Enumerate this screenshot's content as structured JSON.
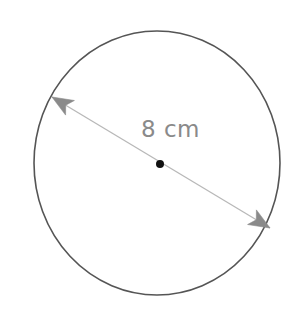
{
  "figure": {
    "name": "circle-with-diameter",
    "type": "geometry-diagram",
    "background_color": "#ffffff",
    "width": 304,
    "height": 311,
    "shape": {
      "name": "circle",
      "center": {
        "x": 157,
        "y": 163
      },
      "radius": 123,
      "stroke_color": "#555555",
      "stroke_width": 1.6,
      "fill": "none"
    },
    "center_point": {
      "name": "center-dot",
      "x": 160,
      "y": 164,
      "radius": 4,
      "color": "#111111"
    },
    "diameter": {
      "name": "diameter-arrow",
      "measure_value": "8 cm",
      "number": "8",
      "unit": "cm",
      "line_color": "#b8b8b8",
      "arrow_color": "#8a8a8a",
      "line_width": 1.3,
      "start": {
        "x": 52,
        "y": 97
      },
      "end": {
        "x": 270,
        "y": 228
      },
      "arrowheads": "both"
    },
    "label": {
      "name": "dimension-label",
      "text": "8 cm",
      "color": "#8a8a8a",
      "font_size": 23,
      "x": 141,
      "y": 118
    }
  },
  "chart_data": {
    "type": "table",
    "xlabel": "",
    "ylabel": "",
    "categories": [
      "diameter"
    ],
    "values": [
      8
    ],
    "units": "cm",
    "annotations": [
      "8 cm"
    ],
    "legend": []
  }
}
